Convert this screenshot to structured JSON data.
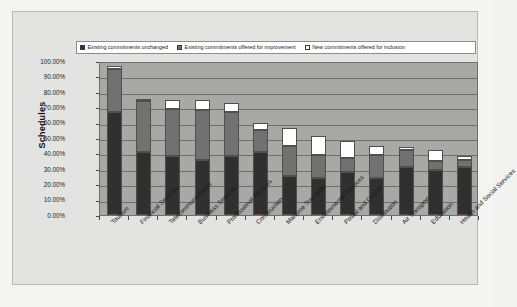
{
  "chart_data": {
    "type": "bar",
    "subtype": "stacked-column",
    "title": "",
    "xlabel": "",
    "ylabel": "Schedules",
    "ylim": [
      0,
      100
    ],
    "ytick_labels": [
      "100.00%",
      "90.00%",
      "80.00%",
      "70.00%",
      "60.00%",
      "50.00%",
      "40.00%",
      "30.00%",
      "20.00%",
      "10.00%",
      "0.00%"
    ],
    "ytick_values": [
      100,
      90,
      80,
      70,
      60,
      50,
      40,
      30,
      20,
      10,
      0
    ],
    "grid": true,
    "legend_position": "top",
    "categories": [
      "Tourism",
      "Financial Services",
      "Telecommunications",
      "Business Services",
      "Professional Services",
      "Construction",
      "Maritime Transport",
      "Environmental Services",
      "Postal and Courier",
      "Distribution",
      "Air Transport",
      "Education",
      "Health and Social Services"
    ],
    "series": [
      {
        "name": "Existing commitments unchanged",
        "color": "#303030",
        "values": [
          67.0,
          41.0,
          38.0,
          36.0,
          38.0,
          41.0,
          25.5,
          24.0,
          28.0,
          24.0,
          31.0,
          29.0,
          31.0
        ]
      },
      {
        "name": "Existing commitments offered for improvement",
        "color": "#717171",
        "values": [
          28.0,
          33.0,
          31.0,
          32.0,
          29.0,
          14.0,
          19.5,
          15.0,
          9.0,
          15.0,
          11.0,
          6.0,
          5.0
        ]
      },
      {
        "name": "New commitments offered for inclusion",
        "color": "#ffffff",
        "values": [
          2.0,
          1.0,
          6.0,
          7.0,
          6.0,
          5.0,
          11.5,
          12.5,
          11.0,
          6.0,
          2.0,
          7.5,
          2.0
        ]
      }
    ],
    "totals": [
      97.0,
      75.0,
      75.0,
      75.0,
      73.0,
      60.0,
      56.5,
      51.5,
      48.0,
      45.0,
      44.0,
      42.5,
      38.0
    ]
  },
  "legend": {
    "items": [
      {
        "label": "Existing commitments unchanged",
        "color": "#303030"
      },
      {
        "label": "Existing commitments offered for improvement",
        "color": "#717171"
      },
      {
        "label": "New commitments offered for inclusion",
        "color": "#ffffff"
      }
    ]
  },
  "axis": {
    "y_title": "Schedules"
  }
}
